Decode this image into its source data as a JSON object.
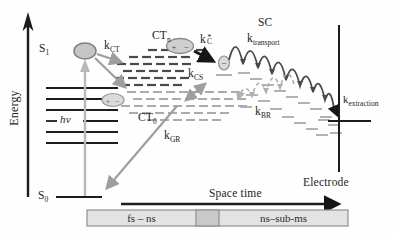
{
  "figure": {
    "energy_axis_label": "Energy",
    "space_time_label": "Space time",
    "electrode_label": "Electrode",
    "states": {
      "s1_base": "S",
      "s1_sub": "1",
      "s0_base": "S",
      "s0_sub": "0",
      "ctn_base": "CT",
      "ctn_sub": "n",
      "ct0_base": "CT",
      "ct0_sub": "0",
      "sc": "SC",
      "photon": "hν"
    },
    "rates": {
      "kct_base": "k",
      "kct_sub": "CT",
      "kc_base": "k",
      "kc_sup": "*",
      "kc_sub": "C",
      "kcs_base": "k",
      "kcs_sub": "CS",
      "kbr_base": "k",
      "kbr_sub": "BR",
      "kgr_base": "k",
      "kgr_sub": "GR",
      "ktransport_base": "k",
      "ktransport_sub": "transport",
      "kextraction_base": "k",
      "kextraction_sub": "extraction"
    },
    "particles": {
      "ctn_plus": "+",
      "ctn_minus": "−",
      "ct0_plus": "+",
      "ct0_minus": "−",
      "electron_minus": "−"
    },
    "timescale": {
      "fast": "fs – ns",
      "slow": "ns–sub-ms"
    },
    "colors": {
      "black": "#1c1c1c",
      "gray_arrow": "#9e9e9e",
      "photon_arrow": "#b8b8b8",
      "dark_dash": "#4a4a4a",
      "light_dash": "#ababab",
      "ellipse_fill": "#cdcdcd",
      "ellipse_stroke": "#8a8a8a",
      "bar_fill": "#e3e3e3",
      "bar_mid": "#c9c9c9",
      "bar_border": "#8f8f8f"
    }
  }
}
